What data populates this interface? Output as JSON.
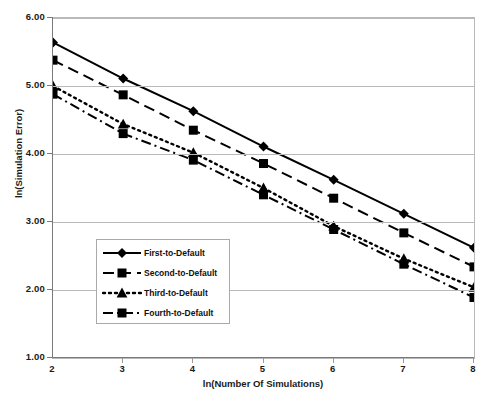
{
  "chart_data": {
    "type": "line",
    "title": "",
    "xlabel": "ln(Number Of Simulations)",
    "ylabel": "ln(Simulation Error)",
    "x": [
      2,
      3,
      4,
      5,
      6,
      7,
      8
    ],
    "xlim": [
      2,
      8
    ],
    "ylim": [
      1.0,
      6.0
    ],
    "xticklabels": [
      "2",
      "3",
      "4",
      "5",
      "6",
      "7",
      "8"
    ],
    "yticklabels": [
      "1.00",
      "2.00",
      "3.00",
      "4.00",
      "5.00",
      "6.00"
    ],
    "yticks": [
      1.0,
      2.0,
      3.0,
      4.0,
      5.0,
      6.0
    ],
    "grid": "horizontal",
    "legend_position": "center-left-inside",
    "series": [
      {
        "name": "First-to-Default",
        "marker": "diamond",
        "linestyle": "solid",
        "values": [
          5.64,
          5.11,
          4.63,
          4.11,
          3.62,
          3.12,
          2.62
        ]
      },
      {
        "name": "Second-to-Default",
        "marker": "square",
        "linestyle": "dashed",
        "values": [
          5.38,
          4.87,
          4.35,
          3.86,
          3.35,
          2.84,
          2.34
        ]
      },
      {
        "name": "Third-to-Default",
        "marker": "triangle",
        "linestyle": "dotted",
        "values": [
          5.0,
          4.44,
          4.02,
          3.5,
          2.94,
          2.46,
          2.04
        ]
      },
      {
        "name": "Fourth-to-Default",
        "marker": "square",
        "linestyle": "dashdot",
        "values": [
          4.88,
          4.3,
          3.91,
          3.4,
          2.89,
          2.38,
          1.89
        ]
      }
    ],
    "colors": {
      "series": "#000000",
      "grid": "#b9b9b9",
      "axis": "#7a7a7a",
      "background": "#ffffff",
      "text": "#111111"
    }
  }
}
